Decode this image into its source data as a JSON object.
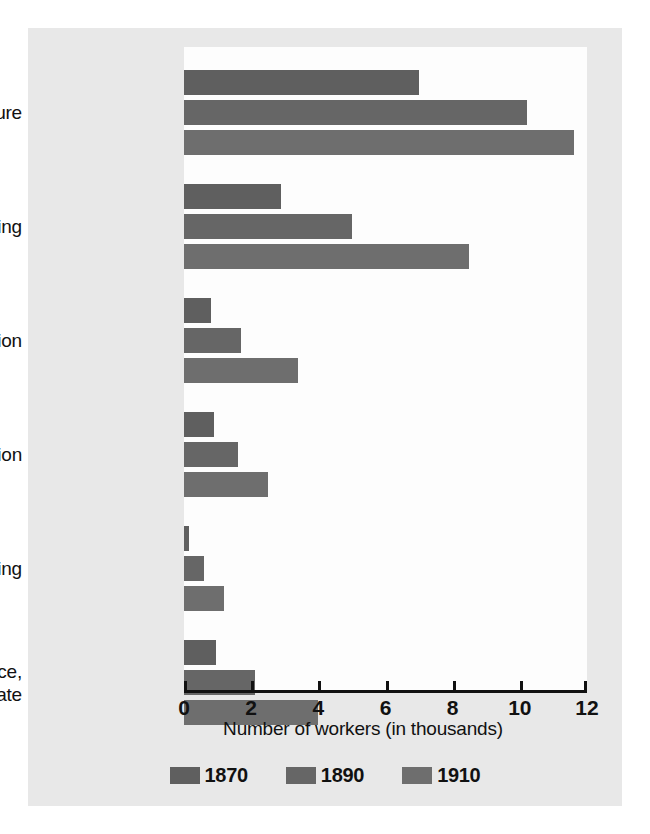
{
  "chart_data": {
    "type": "bar",
    "orientation": "horizontal",
    "title": "",
    "xlabel": "Number of workers (in thousands)",
    "ylabel": "",
    "xlim": [
      0,
      12
    ],
    "xticks": [
      0,
      2,
      4,
      6,
      8,
      10,
      12
    ],
    "xtick_labels": [
      "0",
      "2",
      "4",
      "6",
      "8",
      "10",
      "12"
    ],
    "grid": false,
    "legend_position": "bottom",
    "categories": [
      "Agriculture",
      "Manufacturing",
      "Transportation",
      "Construction",
      "Mining",
      "Trade, finance, real estate"
    ],
    "category_label_lines": [
      [
        "Agriculture"
      ],
      [
        "Manufacturing"
      ],
      [
        "Transportation"
      ],
      [
        "Construction"
      ],
      [
        "Mining"
      ],
      [
        "Trade, finance,",
        "real estate"
      ]
    ],
    "series": [
      {
        "name": "1870",
        "color": "#5f5f5f",
        "values": [
          7.0,
          2.9,
          0.8,
          0.9,
          0.15,
          0.95
        ]
      },
      {
        "name": "1890",
        "color": "#666666",
        "values": [
          10.2,
          5.0,
          1.7,
          1.6,
          0.6,
          2.1
        ]
      },
      {
        "name": "1910",
        "color": "#6e6e6e",
        "values": [
          11.6,
          8.5,
          3.4,
          2.5,
          1.2,
          4.0
        ]
      }
    ]
  },
  "legend": {
    "entries": [
      {
        "label": "1870",
        "color": "#5f5f5f"
      },
      {
        "label": "1890",
        "color": "#666666"
      },
      {
        "label": "1910",
        "color": "#6e6e6e"
      }
    ]
  },
  "style": {
    "figure_background": "#e8e8e8",
    "plot_background": "#fdfdfd",
    "axis_color": "#111111",
    "text_color": "#111111"
  }
}
